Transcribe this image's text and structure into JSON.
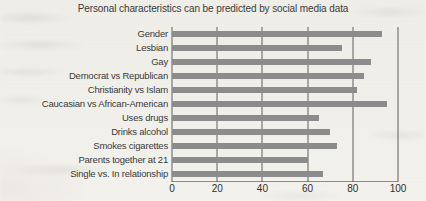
{
  "chart_data": {
    "type": "bar",
    "orientation": "horizontal",
    "title": "Personal characteristics can be predicted by social media data",
    "categories": [
      "Gender",
      "Lesbian",
      "Gay",
      "Democrat vs Republican",
      "Christianity vs Islam",
      "Caucasian vs African-American",
      "Uses drugs",
      "Drinks alcohol",
      "Smokes cigarettes",
      "Parents together at 21",
      "Single vs. In relationship"
    ],
    "values": [
      93,
      75,
      88,
      85,
      82,
      95,
      65,
      70,
      73,
      60,
      67
    ],
    "xlabel": "",
    "ylabel": "",
    "xlim": [
      0,
      100
    ],
    "xticks": [
      0,
      20,
      40,
      60,
      80,
      100
    ],
    "grid": "vertical",
    "legend": "none",
    "bar_color": "#8c8c8c",
    "gridline_color": "#5f5f5f",
    "background_color": "#f2f1ec"
  }
}
